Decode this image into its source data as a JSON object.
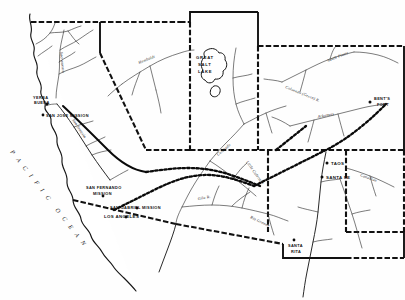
{
  "document": {
    "kind": "historical-map",
    "title": "Map of the American Southwest and Far West, c. 1845",
    "region": "Western United States",
    "background_color": "#ffffff",
    "ink_color": "#111111"
  },
  "ocean": {
    "name_letters": "P A C I F I C",
    "name_letters2": "O  C  E  A  N",
    "name": "PACIFIC OCEAN"
  },
  "lakes": [
    {
      "id": "great-salt-lake",
      "name": "GREAT SALT LAKE",
      "line1": "GREAT",
      "line2": "SALT",
      "line3": "LAKE"
    },
    {
      "id": "utah-lake",
      "name": "Utah Lake",
      "line1": ""
    }
  ],
  "settlements": [
    {
      "id": "yerba-buena",
      "label": "YERBA BUENA",
      "line1": "YERBA",
      "line2": "BUENA",
      "x": 38,
      "y": 96
    },
    {
      "id": "san-jose-mission",
      "label": "SAN JOSE MISSION",
      "x": 46,
      "y": 115
    },
    {
      "id": "san-fernando-mission",
      "label": "SAN FERNANDO MISSION",
      "line1": "SAN FERNANDO",
      "line2": "MISSION",
      "x": 88,
      "y": 188
    },
    {
      "id": "san-gabriel-mission",
      "label": "SAN GABRIEL MISSION",
      "x": 110,
      "y": 209
    },
    {
      "id": "los-angeles",
      "label": "LOS ANGELES",
      "x": 104,
      "y": 216
    },
    {
      "id": "taos",
      "label": "TAOS",
      "x": 332,
      "y": 163
    },
    {
      "id": "santa-fe",
      "label": "SANTA FE",
      "x": 325,
      "y": 177
    },
    {
      "id": "santa-rita",
      "label": "SANTA RITA",
      "line1": "SANTA",
      "line2": "RITA",
      "x": 296,
      "y": 248
    },
    {
      "id": "bents-fort",
      "label": "BENT'S FORT",
      "line1": "BENT'S",
      "line2": "FORT",
      "x": 372,
      "y": 98
    }
  ],
  "rivers": [
    {
      "id": "sacramento",
      "label": "Sacramento"
    },
    {
      "id": "san-joaquin",
      "label": "San Joaquin"
    },
    {
      "id": "humboldt",
      "label": "Humboldt"
    },
    {
      "id": "colorado-green",
      "label": "Colorado (Green) R."
    },
    {
      "id": "south-platte",
      "label": "South Platte"
    },
    {
      "id": "arkansas",
      "label": "Arkansas"
    },
    {
      "id": "colorado",
      "label": "Colorado"
    },
    {
      "id": "little-colorado",
      "label": "Little Colorado"
    },
    {
      "id": "gila",
      "label": "Gila R."
    },
    {
      "id": "rio-grande",
      "label": "Rio Grande"
    },
    {
      "id": "canadian",
      "label": "Canadian"
    }
  ],
  "trails": [
    {
      "id": "old-spanish-trail",
      "label": "Old Spanish Trail"
    },
    {
      "id": "california-trail",
      "label": "California Trail"
    },
    {
      "id": "santa-fe-trail",
      "label": "Santa Fe Trail"
    },
    {
      "id": "gila-trail",
      "label": "Gila Trail"
    }
  ]
}
